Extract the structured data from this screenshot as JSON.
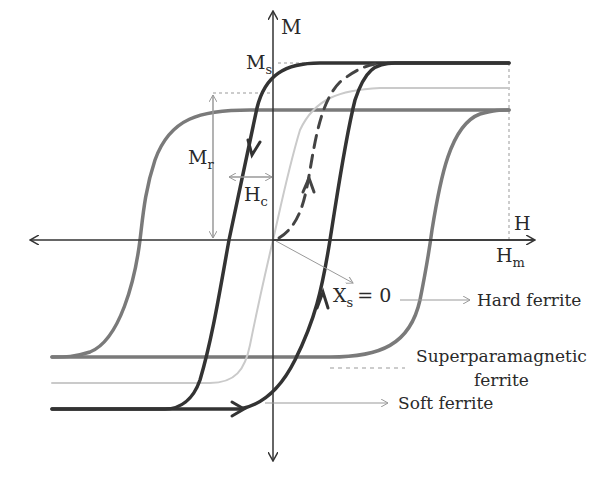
{
  "diagram": {
    "type": "hysteresis-loops",
    "axes": {
      "y_label": "M",
      "x_label": "H",
      "saturation_label": "M",
      "saturation_sub": "s",
      "remanence_label": "M",
      "remanence_sub": "r",
      "coercivity_label": "H",
      "coercivity_sub": "c",
      "max_field_label": "H",
      "max_field_sub": "m"
    },
    "annotation": {
      "label": "X",
      "sub": "s",
      "value": "= 0"
    },
    "curves": [
      {
        "name": "Hard ferrite",
        "label": "Hard ferrite",
        "color": "#7a7a7a"
      },
      {
        "name": "Superparamagnetic ferrite",
        "label_line1": "Superparamagnetic",
        "label_line2": "ferrite",
        "color": "#c8c8c8"
      },
      {
        "name": "Soft ferrite",
        "label": "Soft ferrite",
        "color": "#333333"
      }
    ],
    "initial_magnetization": {
      "style": "dashed",
      "color": "#444444"
    },
    "colors": {
      "axis": "#333333",
      "guide": "#999999",
      "text": "#2a2a2a"
    }
  }
}
